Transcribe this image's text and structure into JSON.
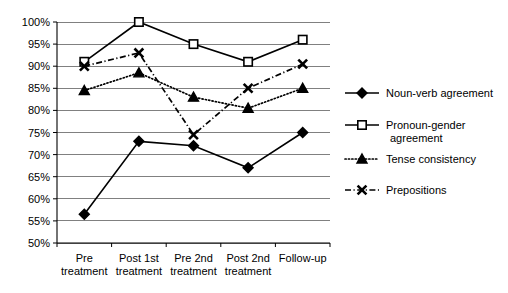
{
  "chart_data": {
    "type": "line",
    "title": "",
    "subtitle": "",
    "xlabel": "",
    "ylabel": "",
    "ylim": [
      50,
      100
    ],
    "ytick_values": [
      50,
      55,
      60,
      65,
      70,
      75,
      80,
      85,
      90,
      95,
      100
    ],
    "ytick_labels": [
      "50%",
      "55%",
      "60%",
      "65%",
      "70%",
      "75%",
      "80%",
      "85%",
      "90%",
      "95%",
      "100%"
    ],
    "grid": true,
    "grid_axis": "y",
    "legend_position": "right",
    "categories": [
      "Pre treatment",
      "Post 1st treatment",
      "Pre 2nd treatment",
      "Post 2nd treatment",
      "Follow-up"
    ],
    "category_lines": [
      [
        "Pre",
        "treatment"
      ],
      [
        "Post 1st",
        "treatment"
      ],
      [
        "Pre 2nd",
        "treatment"
      ],
      [
        "Post 2nd",
        "treatment"
      ],
      [
        "Follow-up"
      ]
    ],
    "series": [
      {
        "name": "Noun-verb agreement",
        "marker": "diamond-filled",
        "linestyle": "solid",
        "color": "#000000",
        "values": [
          56.5,
          73,
          72,
          67,
          75
        ]
      },
      {
        "name": "Pronoun-gender agreement",
        "marker": "square-open",
        "linestyle": "solid",
        "color": "#000000",
        "values": [
          91,
          100,
          95,
          91,
          96
        ]
      },
      {
        "name": "Tense consistency",
        "marker": "triangle-filled",
        "linestyle": "dotted",
        "color": "#000000",
        "values": [
          84.5,
          88.5,
          83,
          80.5,
          85
        ]
      },
      {
        "name": "Prepositions",
        "marker": "x",
        "linestyle": "dash-dot",
        "color": "#000000",
        "values": [
          90,
          93,
          74.5,
          85,
          90.5
        ]
      }
    ]
  },
  "legend": {
    "items": [
      {
        "label_line1": "Noun-verb agreement",
        "label_line2": ""
      },
      {
        "label_line1": "Pronoun-gender",
        "label_line2": "agreement"
      },
      {
        "label_line1": "Tense consistency",
        "label_line2": ""
      },
      {
        "label_line1": "Prepositions",
        "label_line2": ""
      }
    ]
  }
}
